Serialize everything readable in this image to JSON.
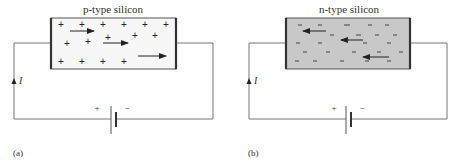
{
  "panels": [
    {
      "id": "a",
      "caption": "(a)",
      "title": "p-type silicon",
      "carrier_symbol": "+",
      "carrier_type": "holes",
      "drift_direction": "right",
      "fill_color": "#f7f7f7",
      "current_label": "I",
      "battery": {
        "plus": "+",
        "minus": "−"
      }
    },
    {
      "id": "b",
      "caption": "(b)",
      "title": "n-type silicon",
      "carrier_symbol": "−",
      "carrier_type": "electrons",
      "drift_direction": "left",
      "fill_color": "#c8c8c8",
      "current_label": "I",
      "battery": {
        "plus": "+",
        "minus": "−"
      }
    }
  ]
}
